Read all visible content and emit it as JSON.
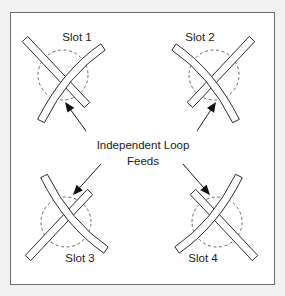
{
  "figure": {
    "background_color": "#f2f2f2",
    "panel_color": "#ffffff",
    "frame_color": "#6b6b6b",
    "line_color": "#2b2b2b",
    "dashed_circle_color": "#5a5a5a",
    "arrow_color": "#111111",
    "width": 285,
    "height": 296
  },
  "callout": {
    "line1": "Independent Loop",
    "line2": "Feeds"
  },
  "slots": [
    {
      "id": "slot-1",
      "label": "Slot 1",
      "label_x": 77,
      "label_y": 38,
      "center_x": 63,
      "center_y": 75,
      "circle_radius": 25,
      "mirror_x": false,
      "mirror_y": false
    },
    {
      "id": "slot-2",
      "label": "Slot 2",
      "label_x": 200,
      "label_y": 38,
      "center_x": 214,
      "center_y": 75,
      "circle_radius": 25,
      "mirror_x": true,
      "mirror_y": false
    },
    {
      "id": "slot-3",
      "label": "Slot 3",
      "label_x": 80,
      "label_y": 259,
      "center_x": 66,
      "center_y": 222,
      "circle_radius": 25,
      "mirror_x": false,
      "mirror_y": true
    },
    {
      "id": "slot-4",
      "label": "Slot 4",
      "label_x": 203,
      "label_y": 259,
      "center_x": 217,
      "center_y": 222,
      "circle_radius": 25,
      "mirror_x": true,
      "mirror_y": true
    }
  ],
  "arrows": [
    {
      "id": "arrow-to-slot-1",
      "from_x": 86,
      "from_y": 131,
      "to_x": 65,
      "to_y": 102,
      "target": "slot-1"
    },
    {
      "id": "arrow-to-slot-2",
      "from_x": 197,
      "from_y": 131,
      "to_x": 216,
      "to_y": 102,
      "target": "slot-2"
    },
    {
      "id": "arrow-to-slot-3",
      "from_x": 101,
      "from_y": 164,
      "to_x": 73,
      "to_y": 195,
      "target": "slot-3"
    },
    {
      "id": "arrow-to-slot-4",
      "from_x": 183,
      "from_y": 164,
      "to_x": 210,
      "to_y": 195,
      "target": "slot-4"
    }
  ]
}
